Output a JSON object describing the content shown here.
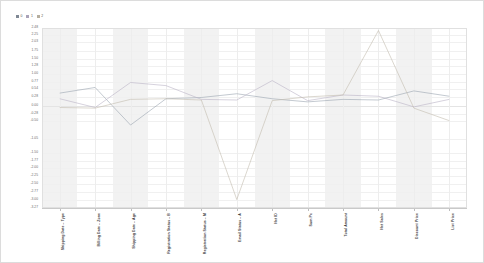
{
  "chart_data": {
    "type": "line",
    "title": "",
    "subtitle": "",
    "xlabel": "",
    "ylabel": "",
    "grid": true,
    "legend_position": "top-left",
    "ylim": [
      -3.27,
      2.48
    ],
    "ytick_labels": [
      "2.48",
      "2.25",
      "2.03",
      "1.75",
      "1.50",
      "1.28",
      "1.00",
      "0.77",
      "0.54",
      "0.28",
      "0.00",
      "-0.28",
      "-0.50",
      "-1.05",
      "-1.50",
      "-1.77",
      "-2.00",
      "-2.25",
      "-2.50",
      "-2.77",
      "-3.00",
      "-3.27"
    ],
    "ytick_values": [
      2.48,
      2.25,
      2.03,
      1.75,
      1.5,
      1.28,
      1.0,
      0.77,
      0.54,
      0.28,
      0.0,
      -0.28,
      -0.5,
      -1.05,
      -1.5,
      -1.77,
      -2.0,
      -2.25,
      -2.5,
      -2.77,
      -3.0,
      -3.27
    ],
    "categories": [
      "Shipping Date – Type",
      "Billing Date – Zone",
      "Shipping Date – Age",
      "Registration Status – B",
      "Registration Status – M",
      "Email Status – A",
      "Net ID",
      "Sum Pc",
      "Total Amount",
      "Net Sales",
      "Discount Price",
      "List Price"
    ],
    "series": [
      {
        "name": "0",
        "color": "#9aa4b0",
        "values": [
          0.4,
          0.58,
          -0.62,
          0.22,
          0.26,
          0.38,
          0.22,
          0.12,
          0.2,
          0.18,
          0.47,
          0.3
        ]
      },
      {
        "name": "1",
        "color": "#b9b3c6",
        "values": [
          0.22,
          -0.06,
          0.74,
          0.64,
          0.2,
          0.18,
          0.8,
          0.16,
          0.34,
          0.3,
          -0.04,
          0.2
        ]
      },
      {
        "name": "2",
        "color": "#c3bcae",
        "values": [
          -0.06,
          -0.08,
          0.2,
          0.22,
          0.18,
          -3.0,
          0.16,
          0.28,
          0.34,
          2.4,
          -0.08,
          -0.48
        ]
      }
    ]
  },
  "legend": {
    "items": [
      {
        "label": "0",
        "color": "#7f8894"
      },
      {
        "label": "1",
        "color": "#a9a2b8"
      },
      {
        "label": "2",
        "color": "#b5ae9f"
      }
    ]
  },
  "plot_style": {
    "band_color": "#f2f2f2",
    "plain_color": "#ffffff",
    "grid_color": "#f0f0f0",
    "axis_color": "#c9c9c9",
    "border_color": "#e0e0e0"
  }
}
